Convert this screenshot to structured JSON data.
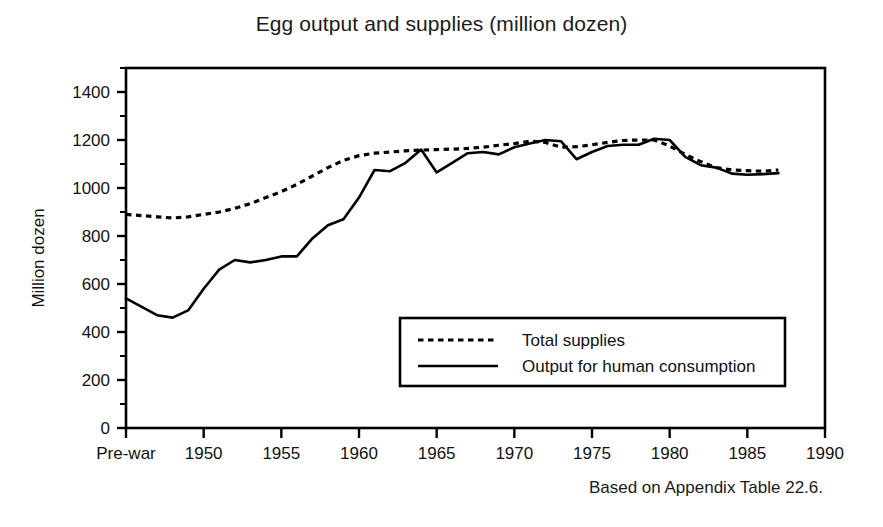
{
  "chart_data": {
    "type": "line",
    "title": "Egg output and supplies (million dozen)",
    "xlabel": "",
    "ylabel": "Million dozen",
    "ylim": [
      0,
      1500
    ],
    "yticks": [
      0,
      200,
      400,
      600,
      800,
      1000,
      1200,
      1400
    ],
    "ytick_labels": [
      "0",
      "200",
      "400",
      "600",
      "800",
      "1000",
      "1200",
      "1400"
    ],
    "minor_yticks": [
      100,
      300,
      500,
      700,
      900,
      1100,
      1300,
      1500
    ],
    "xlim": [
      "Pre-war",
      1990
    ],
    "xticks": [
      "Pre-war",
      "1950",
      "1955",
      "1960",
      "1965",
      "1970",
      "1975",
      "1980",
      "1985",
      "1990"
    ],
    "xtick_labels": [
      "Pre-war",
      "1950",
      "1955",
      "1960",
      "1965",
      "1970",
      "1975",
      "1980",
      "1985",
      "1990"
    ],
    "grid": false,
    "legend_position": "lower right inside plot",
    "source_note": "Based on Appendix Table 22.6.",
    "series": [
      {
        "name": "Total supplies",
        "style": "dotted",
        "x": [
          "Pre-war",
          1947,
          1948,
          1949,
          1950,
          1951,
          1952,
          1953,
          1954,
          1955,
          1956,
          1957,
          1958,
          1959,
          1960,
          1961,
          1962,
          1963,
          1964,
          1965,
          1966,
          1967,
          1968,
          1969,
          1970,
          1971,
          1972,
          1973,
          1974,
          1975,
          1976,
          1977,
          1978,
          1979,
          1980,
          1981,
          1982,
          1983,
          1984,
          1985,
          1986,
          1987
        ],
        "values": [
          890,
          880,
          875,
          880,
          890,
          900,
          915,
          935,
          960,
          985,
          1015,
          1050,
          1085,
          1115,
          1135,
          1145,
          1150,
          1155,
          1158,
          1160,
          1162,
          1165,
          1170,
          1178,
          1185,
          1195,
          1190,
          1170,
          1172,
          1180,
          1190,
          1198,
          1200,
          1200,
          1175,
          1140,
          1110,
          1085,
          1075,
          1072,
          1070,
          1075
        ]
      },
      {
        "name": "Output for human consumption",
        "style": "solid",
        "x": [
          "Pre-war",
          1947,
          1948,
          1949,
          1950,
          1951,
          1952,
          1953,
          1954,
          1955,
          1956,
          1957,
          1958,
          1959,
          1960,
          1961,
          1962,
          1963,
          1964,
          1965,
          1966,
          1967,
          1968,
          1969,
          1970,
          1971,
          1972,
          1973,
          1974,
          1975,
          1976,
          1977,
          1978,
          1979,
          1980,
          1981,
          1982,
          1983,
          1984,
          1985,
          1986,
          1987
        ],
        "values": [
          540,
          470,
          460,
          490,
          580,
          660,
          700,
          690,
          700,
          715,
          715,
          790,
          845,
          870,
          960,
          1075,
          1070,
          1105,
          1160,
          1065,
          1105,
          1145,
          1150,
          1140,
          1170,
          1185,
          1200,
          1195,
          1120,
          1150,
          1175,
          1180,
          1180,
          1205,
          1200,
          1130,
          1095,
          1085,
          1060,
          1055,
          1058,
          1062
        ]
      }
    ]
  },
  "legend": {
    "entries": [
      {
        "label": "Total supplies",
        "style": "dotted"
      },
      {
        "label": "Output for human consumption",
        "style": "solid"
      }
    ]
  }
}
